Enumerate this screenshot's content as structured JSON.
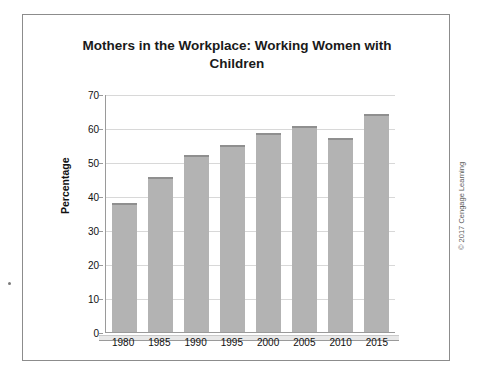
{
  "figure": {
    "copyright": "© 2017 Cengage Learning"
  },
  "chart_data": {
    "type": "bar",
    "title": "Mothers in the Workplace: Working Women with Children",
    "title_line1": "Mothers in the Workplace: Working Women with",
    "title_line2": "Children",
    "xlabel": "",
    "ylabel": "Percentage",
    "categories": [
      "1980",
      "1985",
      "1990",
      "1995",
      "2000",
      "2005",
      "2010",
      "2015"
    ],
    "values": [
      38,
      45.5,
      52,
      55,
      58.5,
      60.5,
      57,
      64
    ],
    "ylim": [
      0,
      70
    ],
    "yticks": [
      0,
      10,
      20,
      30,
      40,
      50,
      60,
      70
    ],
    "ytick_labels": [
      "0",
      "10",
      "20",
      "30",
      "40",
      "50",
      "60",
      "70"
    ],
    "grid": true,
    "legend": null,
    "bar_color": "#b3b3b3"
  }
}
